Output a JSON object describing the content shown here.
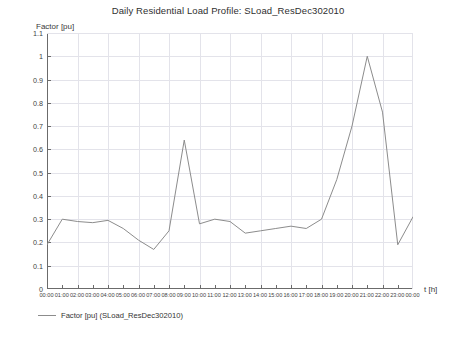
{
  "chart_data": {
    "type": "line",
    "title": "Daily Residential Load Profile: SLoad_ResDec302010",
    "xlabel": "t [h]",
    "ylabel": "Factor [pu]",
    "ylim": [
      0,
      1.1
    ],
    "grid": true,
    "legend_position": "bottom-left",
    "legend": [
      "Factor [pu] (SLoad_ResDec302010)"
    ],
    "series": [
      {
        "name": "Factor [pu] (SLoad_ResDec302010)",
        "color": "#8c8c8c",
        "values": [
          0.19,
          0.3,
          0.29,
          0.285,
          0.295,
          0.26,
          0.21,
          0.17,
          0.25,
          0.64,
          0.28,
          0.3,
          0.29,
          0.24,
          0.25,
          0.26,
          0.27,
          0.26,
          0.3,
          0.47,
          0.7,
          1.0,
          0.76,
          0.19,
          0.31
        ]
      }
    ],
    "categories": [
      "00:00",
      "01:00",
      "02:00",
      "03:00",
      "04:00",
      "05:00",
      "06:00",
      "07:00",
      "08:00",
      "09:00",
      "10:00",
      "11:00",
      "12:00",
      "13:00",
      "14:00",
      "15:00",
      "16:00",
      "17:00",
      "18:00",
      "19:00",
      "20:00",
      "21:00",
      "22:00",
      "23:00",
      "00:00"
    ],
    "ytick_labels": [
      "0",
      "0.1",
      "0.2",
      "0.3",
      "0.4",
      "0.5",
      "0.6",
      "0.7",
      "0.8",
      "0.9",
      "1",
      "1.1"
    ],
    "ytick_values": [
      0,
      0.1,
      0.2,
      0.3,
      0.4,
      0.5,
      0.6,
      0.7,
      0.8,
      0.9,
      1.0,
      1.1
    ],
    "colors": {
      "line": "#8c8c8c",
      "grid": "#e3e3ea",
      "axis": "#6b6b6b",
      "text": "#3a3a3a",
      "background": "#ffffff"
    }
  }
}
